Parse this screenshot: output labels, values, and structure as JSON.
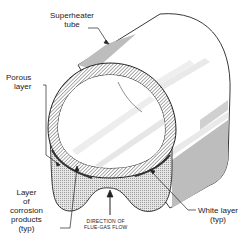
{
  "figure": {
    "labels": {
      "superheater_tube": [
        "Superheater",
        "tube"
      ],
      "porous_layer": [
        "Porous",
        "layer"
      ],
      "corrosion_layer": [
        "Layer",
        "of",
        "corrosion",
        "products",
        "(typ)"
      ],
      "flow_direction": [
        "DIRECTION OF",
        "FLUE-GAS FLOW"
      ],
      "white_layer": [
        "White layer",
        "(typ)"
      ]
    },
    "colors": {
      "outline": "#222222",
      "hatch": "#555555",
      "deposit_fill": "#d9d9d9",
      "side_shade": "#bdbdbd",
      "highlight": "#eeeeee",
      "background": "#ffffff"
    }
  }
}
